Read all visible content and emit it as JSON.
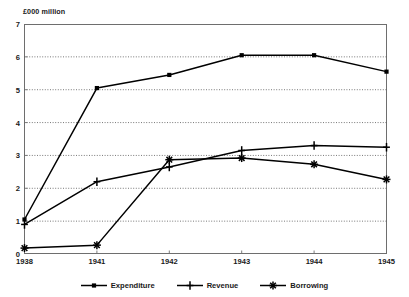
{
  "chart_data": {
    "type": "line",
    "title": "",
    "subtitle": "",
    "unit_caption": "£000 million",
    "xlabel": "",
    "ylabel": "",
    "categories": [
      "1938",
      "1941",
      "1942",
      "1943",
      "1944",
      "1945"
    ],
    "ylim": [
      0,
      7
    ],
    "ytick_labels": [
      "0",
      "1",
      "2",
      "3",
      "4",
      "5",
      "6",
      "7"
    ],
    "ytick_values": [
      0,
      1,
      2,
      3,
      4,
      5,
      6,
      7
    ],
    "grid": "horizontal-dotted",
    "legend_position": "bottom-center",
    "series": [
      {
        "name": "Expenditure",
        "marker": "filled-square",
        "color": "#000000",
        "values": [
          1.05,
          5.05,
          5.45,
          6.05,
          6.05,
          5.55
        ]
      },
      {
        "name": "Revenue",
        "marker": "vertical-bar-plus",
        "color": "#000000",
        "values": [
          0.9,
          2.2,
          2.65,
          3.15,
          3.3,
          3.25
        ]
      },
      {
        "name": "Borrowing",
        "marker": "asterisk",
        "color": "#000000",
        "values": [
          0.18,
          0.27,
          2.87,
          2.92,
          2.73,
          2.27
        ]
      }
    ]
  },
  "legend": {
    "items": [
      {
        "label": "Expenditure",
        "marker": "filled-square"
      },
      {
        "label": "Revenue",
        "marker": "vertical-bar-plus"
      },
      {
        "label": "Borrowing",
        "marker": "asterisk"
      }
    ]
  },
  "style": {
    "frame_color": "#6e6e6e",
    "grid_color": "#555555",
    "line_color": "#000000",
    "text_color": "#1a1a1a",
    "background": "#ffffff"
  }
}
